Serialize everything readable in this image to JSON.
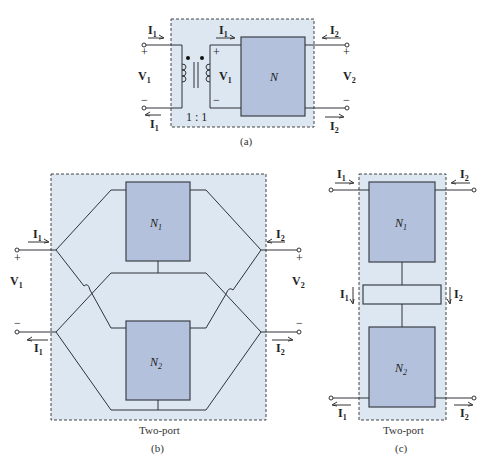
{
  "figure_a": {
    "caption": "(a)",
    "network_label": "N",
    "transformer_ratio": "1 : 1",
    "port1": {
      "current": "I",
      "current_sub": "1",
      "voltage": "V",
      "voltage_sub": "1",
      "plus": "+",
      "minus": "−"
    },
    "port2": {
      "current": "I",
      "current_sub": "2",
      "voltage": "V",
      "voltage_sub": "2",
      "plus": "+",
      "minus": "−"
    },
    "inner_current": {
      "label": "I",
      "sub": "1"
    },
    "inner_voltage": {
      "label": "V",
      "sub": "1",
      "plus": "+",
      "minus": "−"
    }
  },
  "figure_b": {
    "caption": "(b)",
    "box_label": "Two-port",
    "network1": {
      "label": "N",
      "sub": "1"
    },
    "network2": {
      "label": "N",
      "sub": "2"
    },
    "port1": {
      "current": "I",
      "current_sub": "1",
      "voltage": "V",
      "voltage_sub": "1",
      "plus": "+",
      "minus": "−"
    },
    "port2": {
      "current": "I",
      "current_sub": "2",
      "voltage": "V",
      "voltage_sub": "2",
      "plus": "+",
      "minus": "−"
    }
  },
  "figure_c": {
    "caption": "(c)",
    "box_label": "Two-port",
    "network1": {
      "label": "N",
      "sub": "1"
    },
    "network2": {
      "label": "N",
      "sub": "2"
    },
    "port1": {
      "current": "I",
      "current_sub": "1"
    },
    "port2": {
      "current": "I",
      "current_sub": "2"
    },
    "middle_currents": {
      "left": "I",
      "left_sub": "1",
      "right": "I",
      "right_sub": "2"
    }
  }
}
